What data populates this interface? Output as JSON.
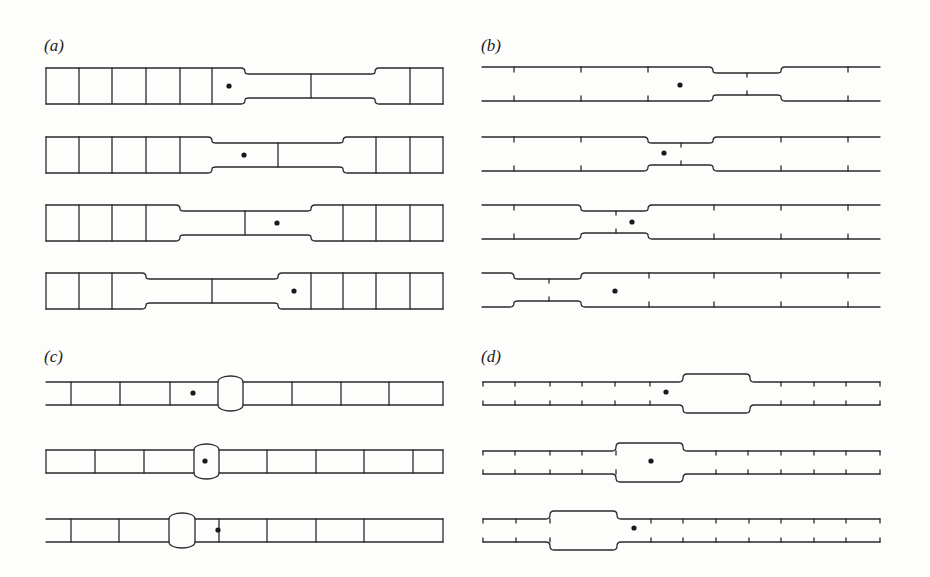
{
  "panels": {
    "a": {
      "label": "(a)",
      "description": "Segmented bar with cells; a narrowed neck (two cells) travels leftward; dot marks a tracked cell"
    },
    "b": {
      "label": "(b)",
      "description": "Continuous tube with tick marks; narrowed constriction travels leftward; dot tracks material"
    },
    "c": {
      "label": "(c)",
      "description": "Segmented bar with a single bulge; bulge moves leftward relative to dot"
    },
    "d": {
      "label": "(d)",
      "description": "Continuous tube with tick marks; wide bulge travels leftward; dot tracks material"
    }
  },
  "colors": {
    "stroke": "#2a2a2a",
    "background": "#fdfdfc",
    "dot": "#1a1a1a"
  },
  "geometry": {
    "a": {
      "rows": [
        {
          "y": 68,
          "dividers": [
            79,
            112,
            146,
            180,
            212
          ],
          "neck": [
            245,
            375
          ],
          "neck_divider": 311,
          "right_dividers": [
            410
          ],
          "dot": [
            229,
            86
          ]
        },
        {
          "y": 137,
          "dividers": [
            79,
            112,
            146,
            180
          ],
          "neck": [
            212,
            343
          ],
          "neck_divider": 278,
          "right_dividers": [
            376,
            410
          ],
          "dot": [
            244,
            155
          ]
        },
        {
          "y": 205,
          "dividers": [
            79,
            112,
            146
          ],
          "neck": [
            180,
            311
          ],
          "neck_divider": 245,
          "right_dividers": [
            343,
            376,
            410
          ],
          "dot": [
            277,
            223
          ]
        },
        {
          "y": 273,
          "dividers": [
            79,
            112
          ],
          "neck": [
            146,
            278
          ],
          "neck_divider": 212,
          "right_dividers": [
            311,
            343,
            376,
            410
          ],
          "dot": [
            294,
            291
          ]
        }
      ],
      "x_start": 46,
      "x_end": 443,
      "height": 36,
      "neck_inset": 6
    },
    "b": {
      "rows": [
        {
          "y": 67,
          "ticks": [
            514,
            581,
            648,
            848
          ],
          "neck": [
            713,
            781
          ],
          "neck_ticks": [
            747
          ],
          "dot": [
            680,
            85
          ]
        },
        {
          "y": 137,
          "ticks": [
            514,
            581,
            781,
            848
          ],
          "neck": [
            648,
            713
          ],
          "neck_ticks": [
            681
          ],
          "dot": [
            664,
            153
          ]
        },
        {
          "y": 205,
          "ticks": [
            514,
            714,
            781,
            848
          ],
          "neck": [
            581,
            648
          ],
          "neck_ticks": [
            616
          ],
          "dot": [
            632,
            222
          ]
        },
        {
          "y": 273,
          "ticks": [
            649,
            714,
            781,
            848
          ],
          "neck": [
            514,
            581
          ],
          "neck_ticks": [
            549
          ],
          "dot": [
            615,
            291
          ]
        }
      ],
      "x_start": 482,
      "x_end": 880,
      "height": 34,
      "neck_inset": 6
    },
    "c": {
      "rows": [
        {
          "y": 382,
          "open_left": true,
          "dividers": [
            71,
            120,
            170,
            292,
            341,
            389
          ],
          "bulge": [
            218,
            243
          ],
          "dot": [
            193,
            393
          ],
          "close_right": true
        },
        {
          "y": 450,
          "open_left": false,
          "dividers": [
            95,
            144,
            267,
            316,
            364,
            413
          ],
          "bulge": [
            194,
            219
          ],
          "dot": [
            205,
            461
          ],
          "close_right": true
        },
        {
          "y": 519,
          "open_left": true,
          "dividers": [
            71,
            119,
            219,
            267,
            316,
            364
          ],
          "bulge": [
            169,
            195
          ],
          "dot": [
            218,
            530
          ],
          "close_right": true
        }
      ],
      "x_start": 46,
      "x_end": 443,
      "height": 23,
      "bulge_out": 8
    },
    "d": {
      "rows": [
        {
          "y": 382,
          "ticks": [
            515,
            550,
            582,
            615,
            650,
            781,
            814,
            846
          ],
          "bulge": [
            683,
            750
          ],
          "dot": [
            666,
            392
          ]
        },
        {
          "y": 451,
          "ticks": [
            515,
            550,
            582,
            616,
            716,
            748,
            781,
            814,
            846
          ],
          "bulge": [
            616,
            683
          ],
          "dot": [
            651,
            461
          ]
        },
        {
          "y": 519,
          "ticks": [
            516,
            550,
            651,
            683,
            716,
            749,
            781,
            814,
            846
          ],
          "bulge": [
            550,
            617
          ],
          "dot": [
            634,
            528
          ]
        }
      ],
      "x_start": 483,
      "x_end": 880,
      "height": 23,
      "bulge_out": 8
    }
  }
}
